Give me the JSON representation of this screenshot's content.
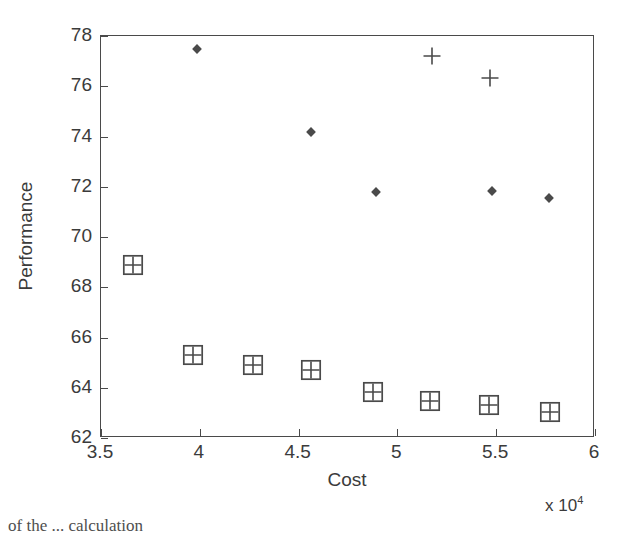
{
  "chart_data": {
    "type": "scatter",
    "title": "",
    "xlabel": "Cost",
    "ylabel": "Performance",
    "x_multiplier": "x 10",
    "x_multiplier_exponent": "4",
    "xlim": [
      3.5,
      6
    ],
    "ylim": [
      62,
      78
    ],
    "xticks": [
      "3.5",
      "4",
      "4.5",
      "5",
      "5.5",
      "6"
    ],
    "xtick_values": [
      3.5,
      4,
      4.5,
      5,
      5.5,
      6
    ],
    "yticks": [
      "62",
      "64",
      "66",
      "68",
      "70",
      "72",
      "74",
      "76",
      "78"
    ],
    "ytick_values": [
      62,
      64,
      66,
      68,
      70,
      72,
      74,
      76,
      78
    ],
    "grid": false,
    "legend": "none",
    "box": true,
    "series": [
      {
        "name": "diamond-series",
        "marker": "diamond",
        "color": "#4a4a4a",
        "points": [
          {
            "x": 3.985,
            "y": 77.47
          },
          {
            "x": 4.562,
            "y": 74.18
          },
          {
            "x": 4.893,
            "y": 71.8
          },
          {
            "x": 5.48,
            "y": 71.82
          },
          {
            "x": 5.765,
            "y": 71.55
          }
        ]
      },
      {
        "name": "plus-series",
        "marker": "plus",
        "color": "#4a4a4a",
        "points": [
          {
            "x": 5.175,
            "y": 77.2
          },
          {
            "x": 5.47,
            "y": 76.32
          },
          {
            "x": 3.66,
            "y": 68.9
          },
          {
            "x": 3.965,
            "y": 65.32
          },
          {
            "x": 4.27,
            "y": 64.92
          },
          {
            "x": 4.565,
            "y": 64.72
          },
          {
            "x": 4.875,
            "y": 63.85
          },
          {
            "x": 5.165,
            "y": 63.48
          },
          {
            "x": 5.465,
            "y": 63.32
          },
          {
            "x": 5.77,
            "y": 63.02
          }
        ]
      },
      {
        "name": "square-series",
        "marker": "square",
        "color": "#4a4a4a",
        "points": [
          {
            "x": 3.66,
            "y": 68.9
          },
          {
            "x": 3.965,
            "y": 65.32
          },
          {
            "x": 4.27,
            "y": 64.92
          },
          {
            "x": 4.565,
            "y": 64.72
          },
          {
            "x": 4.875,
            "y": 63.85
          },
          {
            "x": 5.165,
            "y": 63.48
          },
          {
            "x": 5.465,
            "y": 63.32
          },
          {
            "x": 5.77,
            "y": 63.02
          }
        ]
      }
    ]
  },
  "caption": {
    "text": "of the ... calculation"
  }
}
